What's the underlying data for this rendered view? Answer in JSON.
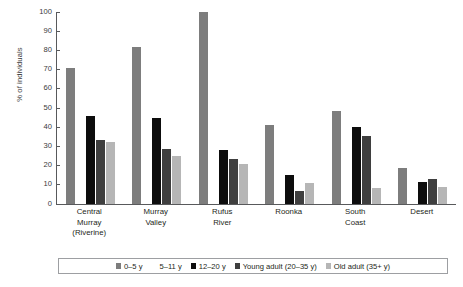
{
  "chart_data": {
    "type": "bar",
    "title": "",
    "subtitle": "",
    "xlabel": "",
    "ylabel": "% of individuals",
    "ylim": [
      0,
      100
    ],
    "ytick_labels": [
      "100",
      "90",
      "80",
      "70",
      "60",
      "50",
      "40",
      "30",
      "20",
      "10",
      "0"
    ],
    "ytick_values": [
      100,
      90,
      80,
      70,
      60,
      50,
      40,
      30,
      20,
      10,
      0
    ],
    "grid": false,
    "legend_position": "bottom",
    "categories": [
      "Central Murray (Riverine)",
      "Murray Valley",
      "Rufus River",
      "Roonka",
      "South Coast",
      "Desert"
    ],
    "category_lines": [
      [
        "Central",
        "Murray",
        "(Riverine)"
      ],
      [
        "Murray",
        "Valley"
      ],
      [
        "Rufus",
        "River"
      ],
      [
        "Roonka"
      ],
      [
        "South",
        "Coast"
      ],
      [
        "Desert"
      ]
    ],
    "series": [
      {
        "name": "0–5 y",
        "color": "#7d7d7d",
        "values": [
          71,
          82,
          100,
          41,
          48.5,
          19
        ]
      },
      {
        "name": "5–11 y",
        "color": "#ffffff",
        "values": [
          0,
          0,
          0,
          0,
          0,
          0
        ]
      },
      {
        "name": "12–20 y",
        "color": "#0d0d0d",
        "values": [
          46,
          45,
          28,
          15,
          40,
          11.5
        ]
      },
      {
        "name": "Young adult (20–35 y)",
        "color": "#3f3f3f",
        "values": [
          33.5,
          28.5,
          23.5,
          7,
          35.5,
          13
        ]
      },
      {
        "name": "Old adult (35+ y)",
        "color": "#b6b6b6",
        "values": [
          32.5,
          25,
          21,
          11,
          8.5,
          9
        ]
      }
    ]
  },
  "legend": {
    "entries": [
      {
        "label": "0–5 y",
        "color": "#7d7d7d"
      },
      {
        "label": "5–11 y",
        "color": "#ffffff"
      },
      {
        "label": "12–20 y",
        "color": "#0d0d0d"
      },
      {
        "label": "Young adult (20–35 y)",
        "color": "#3f3f3f"
      },
      {
        "label": "Old adult (35+ y)",
        "color": "#b6b6b6"
      }
    ]
  },
  "axis": {
    "line_color": "#58595b"
  }
}
